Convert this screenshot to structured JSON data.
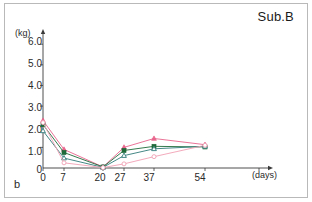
{
  "panel": {
    "letter": "b",
    "title": "Sub.B"
  },
  "axes": {
    "y_unit": "(kg)",
    "x_unit": "(days)",
    "y_ticks": [
      "6.0",
      "5.0",
      "4.0",
      "3.0",
      "2.0",
      "1.0",
      "0"
    ],
    "x_ticks": [
      "0",
      "7",
      "20",
      "27",
      "37",
      "54"
    ]
  },
  "colors": {
    "series_1": "#e8648c",
    "series_2": "#1f6b3a",
    "series_3": "#2f7a78",
    "series_4": "#f0a0b4",
    "axis": "#3a3a3a",
    "frame": "#b9b9b9",
    "text": "#1a1a1a"
  },
  "chart_data": {
    "type": "line",
    "title": "Sub.B",
    "xlabel": "(days)",
    "ylabel": "(kg)",
    "x": [
      0,
      7,
      20,
      27,
      37,
      54
    ],
    "xlim": [
      0,
      75
    ],
    "ylim": [
      0,
      6.3
    ],
    "grid": false,
    "legend": "none",
    "series": [
      {
        "name": "series_1",
        "marker": "triangle",
        "color": "#e8648c",
        "values": [
          2.3,
          0.9,
          0.05,
          1.0,
          1.43,
          1.13
        ]
      },
      {
        "name": "series_2",
        "marker": "square",
        "color": "#1f6b3a",
        "values": [
          2.1,
          0.75,
          0.05,
          0.85,
          1.05,
          1.02
        ]
      },
      {
        "name": "series_3",
        "marker": "triangle-open",
        "color": "#2f7a78",
        "values": [
          1.8,
          0.48,
          0.03,
          0.6,
          0.93,
          1.05
        ]
      },
      {
        "name": "series_4",
        "marker": "circle-open",
        "color": "#f0a0b4",
        "values": [
          2.2,
          0.25,
          0.02,
          0.2,
          0.55,
          1.1
        ]
      }
    ]
  }
}
